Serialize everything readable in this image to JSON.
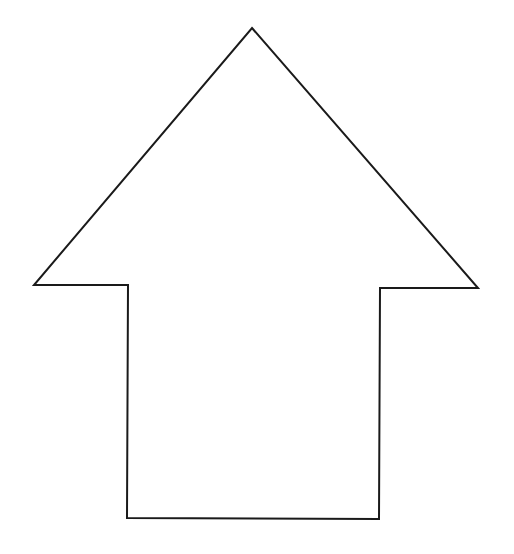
{
  "diagram": {
    "shape": "up-arrow",
    "background": "#ffffff",
    "fill": "#ffffff",
    "stroke": "#1a1a1a",
    "stroke_width": 2,
    "points": [
      [
        252,
        28
      ],
      [
        478,
        288
      ],
      [
        380,
        288
      ],
      [
        379,
        519
      ],
      [
        127,
        518
      ],
      [
        128,
        285
      ],
      [
        34,
        285
      ]
    ]
  }
}
